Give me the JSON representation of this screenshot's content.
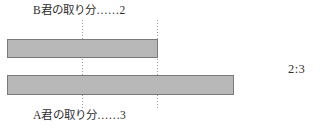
{
  "figure": {
    "width": 320,
    "height": 129,
    "background": "#ffffff"
  },
  "labels": {
    "top": "B君の取り分……2",
    "bottom": "A君の取り分……3"
  },
  "annotation": {
    "ratio": "2:3"
  },
  "colors": {
    "bar_fill": "#b8b8b8",
    "bar_border": "#7a7a7a",
    "guide_line": "#9a9a9a",
    "text": "#2e2e2e"
  },
  "chart_data": {
    "type": "bar",
    "title": "",
    "subtitle": "",
    "xlabel": "",
    "ylabel": "",
    "orientation": "horizontal",
    "categories": [
      "B君の取り分……2",
      "A君の取り分……3"
    ],
    "values": [
      2,
      3
    ],
    "unit_length_px": 75.5,
    "bars": [
      {
        "name": "B君の取り分",
        "label": "B君の取り分……2",
        "value": 2,
        "x_start_px": 7,
        "x_end_px": 158,
        "y_top_px": 39,
        "y_bottom_px": 58,
        "fill": "#b8b8b8",
        "border": "#7a7a7a"
      },
      {
        "name": "A君の取り分",
        "label": "A君の取り分……3",
        "value": 3,
        "x_start_px": 7,
        "x_end_px": 234,
        "y_top_px": 75,
        "y_bottom_px": 95,
        "fill": "#b8b8b8",
        "border": "#7a7a7a"
      }
    ],
    "guide_lines": [
      {
        "name": "unit-1",
        "x_px": 82,
        "units": 1,
        "style": "dotted"
      },
      {
        "name": "unit-2",
        "x_px": 157,
        "units": 2,
        "style": "dotted"
      }
    ],
    "annotations": [
      {
        "name": "ratio",
        "text": "2:3",
        "x_px": 290,
        "y_px": 69
      }
    ],
    "grid": false,
    "legend": "none"
  }
}
